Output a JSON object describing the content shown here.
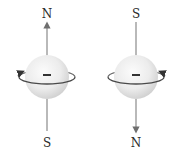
{
  "colors": {
    "background": "#ffffff",
    "sphere_light": "#f7f7f7",
    "sphere_mid": "#e6e6e6",
    "sphere_dark": "#c9c9c9",
    "axis_line": "#8a8a8a",
    "rotation_arrow": "#4a4a4a",
    "text": "#2a2a2a"
  },
  "particles": [
    {
      "id": "left",
      "charge_sign": "−",
      "top_pole": "N",
      "bottom_pole": "S",
      "moment_direction": "up",
      "rotation_arrowhead_side": "left"
    },
    {
      "id": "right",
      "charge_sign": "−",
      "top_pole": "S",
      "bottom_pole": "N",
      "moment_direction": "down",
      "rotation_arrowhead_side": "right"
    }
  ]
}
